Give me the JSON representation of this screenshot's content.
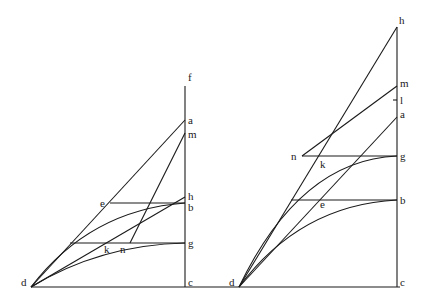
{
  "figures": [
    {
      "id": "left",
      "labels": {
        "f": "f",
        "a": "a",
        "m": "m",
        "h": "h",
        "b": "b",
        "g": "g",
        "c": "c",
        "d": "d",
        "e": "e",
        "k": "k",
        "n": "n"
      }
    },
    {
      "id": "right",
      "labels": {
        "h": "h",
        "m": "m",
        "l": "l",
        "a": "a",
        "g": "g",
        "b": "b",
        "c": "c",
        "d": "d",
        "e": "e",
        "k": "k",
        "n": "n"
      }
    }
  ]
}
